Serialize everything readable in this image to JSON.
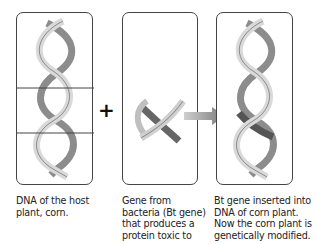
{
  "panels": [
    {
      "id": "host-dna",
      "caption_lines": [
        "DNA of the host",
        "plant, corn."
      ],
      "icon": "dna-double-helix-icon"
    },
    {
      "id": "bt-gene",
      "caption_lines": [
        "Gene from",
        "bacteria (Bt gene)",
        "that produces a",
        "protein toxic to"
      ],
      "icon": "gene-fragment-icon"
    },
    {
      "id": "modified-dna",
      "caption_lines": [
        "Bt gene inserted into",
        "DNA of corn plant.",
        "Now the corn plant is",
        "genetically modified."
      ],
      "icon": "modified-dna-helix-icon"
    }
  ],
  "operators": {
    "plus": "+",
    "arrow": "right-arrow-icon"
  },
  "colors": {
    "strand_light": "#d9d9d9",
    "strand_dark": "#8c8c8c",
    "inserted_segment": "#555555",
    "outline": "#444444"
  }
}
